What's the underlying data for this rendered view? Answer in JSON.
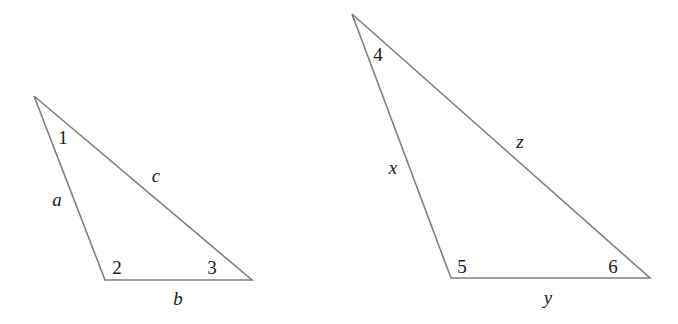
{
  "figure": {
    "background_color": "#ffffff",
    "stroke_color": "#7f7f7f",
    "text_color": "#1b1b1b",
    "stroke_width": 1.6
  },
  "triangles": [
    {
      "id": "left-triangle",
      "name": "left-triangle",
      "vertices": {
        "apex": {
          "x": 34,
          "y": 96
        },
        "bottom_left": {
          "x": 105,
          "y": 280
        },
        "bottom_right": {
          "x": 252,
          "y": 280
        }
      },
      "angle_labels": [
        {
          "id": "angle-1",
          "text": "1",
          "x": 63,
          "y": 138
        },
        {
          "id": "angle-2",
          "text": "2",
          "x": 117,
          "y": 268
        },
        {
          "id": "angle-3",
          "text": "3",
          "x": 212,
          "y": 268
        }
      ],
      "side_labels": [
        {
          "id": "side-a",
          "text": "a",
          "x": 57,
          "y": 200
        },
        {
          "id": "side-c",
          "text": "c",
          "x": 156,
          "y": 176
        },
        {
          "id": "side-b",
          "text": "b",
          "x": 178,
          "y": 299
        }
      ]
    },
    {
      "id": "right-triangle",
      "name": "right-triangle",
      "vertices": {
        "apex": {
          "x": 352,
          "y": 14
        },
        "bottom_left": {
          "x": 451,
          "y": 278
        },
        "bottom_right": {
          "x": 650,
          "y": 278
        }
      },
      "angle_labels": [
        {
          "id": "angle-4",
          "text": "4",
          "x": 378,
          "y": 55
        },
        {
          "id": "angle-5",
          "text": "5",
          "x": 462,
          "y": 267
        },
        {
          "id": "angle-6",
          "text": "6",
          "x": 613,
          "y": 267
        }
      ],
      "side_labels": [
        {
          "id": "side-x",
          "text": "x",
          "x": 393,
          "y": 168
        },
        {
          "id": "side-z",
          "text": "z",
          "x": 520,
          "y": 142
        },
        {
          "id": "side-y",
          "text": "y",
          "x": 548,
          "y": 298
        }
      ]
    }
  ]
}
